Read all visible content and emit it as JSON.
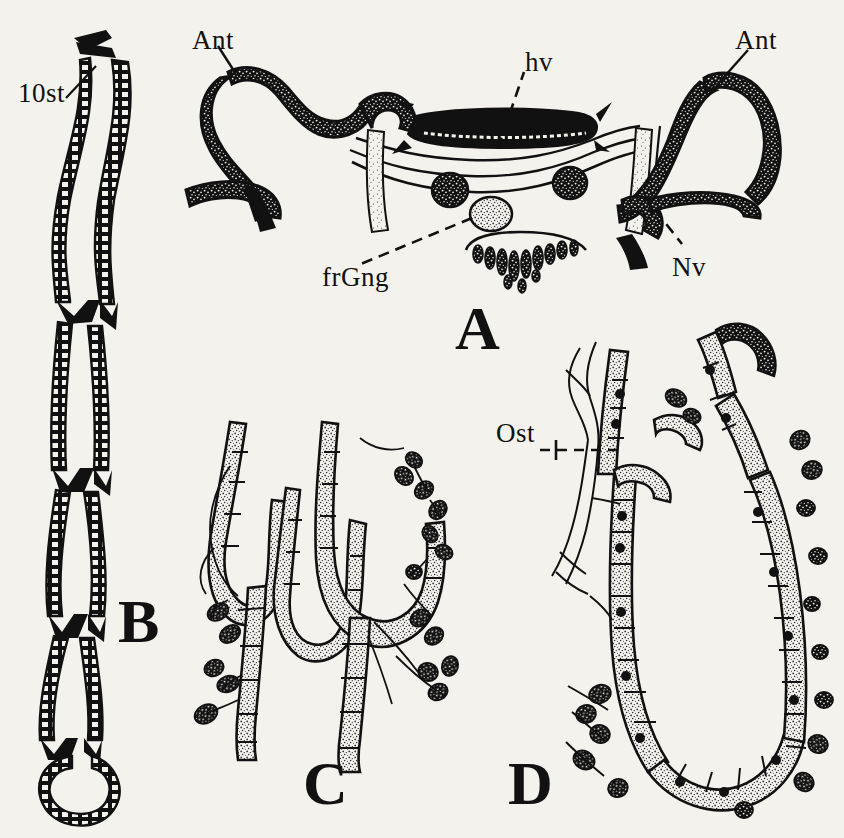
{
  "figure": {
    "background_color": "#f4f2ed",
    "ink_color": "#111111",
    "width": 844,
    "height": 838,
    "style": "pen-and-ink stippled anatomical line drawing"
  },
  "panels": [
    {
      "id": "A",
      "letter": "A",
      "description": "Dorsal view of head/thoracic aorta region showing antennal vessels, heart vessel, nerves and frontal ganglion",
      "letter_pos": {
        "x": 455,
        "y": 297
      }
    },
    {
      "id": "B",
      "letter": "B",
      "description": "Long segmented ladder-like dorsal vessel terminating in a closed loop",
      "letter_pos": {
        "x": 118,
        "y": 590
      }
    },
    {
      "id": "C",
      "letter": "C",
      "description": "Stippled tubular tracheal branches with dark nodular cells and fine nerve filaments",
      "letter_pos": {
        "x": 303,
        "y": 752
      }
    },
    {
      "id": "D",
      "letter": "D",
      "description": "U-shaped segmented vessel with ostium, stippled cells and dark nuclei",
      "letter_pos": {
        "x": 508,
        "y": 752
      }
    }
  ],
  "labels": [
    {
      "name": "10st",
      "text": "10st",
      "x": 18,
      "y": 78,
      "panel": "B",
      "leader": "line"
    },
    {
      "name": "Ant-left",
      "text": "Ant",
      "x": 192,
      "y": 25,
      "panel": "A",
      "leader": "line"
    },
    {
      "name": "hv",
      "text": "hv",
      "x": 525,
      "y": 47,
      "panel": "A",
      "leader": "dashed"
    },
    {
      "name": "Ant-right",
      "text": "Ant",
      "x": 735,
      "y": 25,
      "panel": "A",
      "leader": "line"
    },
    {
      "name": "Nv",
      "text": "Nv",
      "x": 672,
      "y": 252,
      "panel": "A",
      "leader": "dashed"
    },
    {
      "name": "frGng",
      "text": "frGng",
      "x": 322,
      "y": 262,
      "panel": "A",
      "leader": "dashed"
    },
    {
      "name": "Ost",
      "text": "Ost",
      "x": 496,
      "y": 418,
      "panel": "D",
      "leader": "dashed"
    }
  ],
  "legend_keys": {
    "10st": "tenth sternum",
    "Ant": "antennal vessel",
    "hv": "heart vessel",
    "Nv": "nerve",
    "frGng": "frontal ganglion",
    "Ost": "ostium"
  }
}
